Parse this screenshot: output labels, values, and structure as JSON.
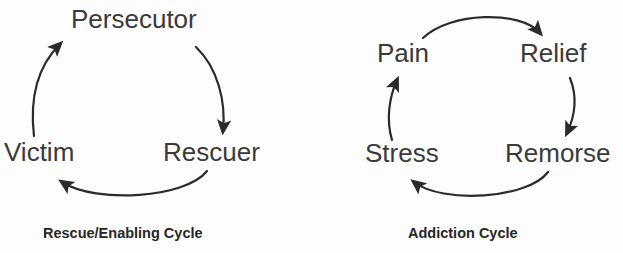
{
  "page": {
    "background_color": "#fdfdfd",
    "ink_color": "#2b2b2b",
    "label_color": "#3a3a3a",
    "caption_color": "#262626"
  },
  "diagrams": [
    {
      "id": "rescue-enabling-cycle",
      "caption": "Rescue/Enabling Cycle",
      "nodes": [
        {
          "id": "persecutor",
          "label": "Persecutor"
        },
        {
          "id": "rescuer",
          "label": "Rescuer"
        },
        {
          "id": "victim",
          "label": "Victim"
        }
      ],
      "edges": [
        {
          "from": "victim",
          "to": "persecutor",
          "arrow": "arrow-victim-to-persecutor"
        },
        {
          "from": "persecutor",
          "to": "rescuer",
          "arrow": "arrow-persecutor-to-rescuer"
        },
        {
          "from": "rescuer",
          "to": "victim",
          "arrow": "arrow-rescuer-to-victim"
        }
      ]
    },
    {
      "id": "addiction-cycle",
      "caption": "Addiction Cycle",
      "nodes": [
        {
          "id": "pain",
          "label": "Pain"
        },
        {
          "id": "relief",
          "label": "Relief"
        },
        {
          "id": "remorse",
          "label": "Remorse"
        },
        {
          "id": "stress",
          "label": "Stress"
        }
      ],
      "edges": [
        {
          "from": "pain",
          "to": "relief",
          "arrow": "arrow-pain-to-relief"
        },
        {
          "from": "relief",
          "to": "remorse",
          "arrow": "arrow-relief-to-remorse"
        },
        {
          "from": "remorse",
          "to": "stress",
          "arrow": "arrow-remorse-to-stress"
        },
        {
          "from": "stress",
          "to": "pain",
          "arrow": "arrow-stress-to-pain"
        }
      ]
    }
  ]
}
